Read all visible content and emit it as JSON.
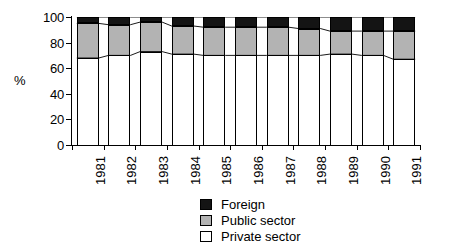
{
  "chart_data": {
    "type": "bar",
    "subtype": "stacked-column-100",
    "title": "",
    "xlabel": "",
    "ylabel": "%",
    "ylim": [
      0,
      100
    ],
    "yticks": [
      0,
      20,
      40,
      60,
      80,
      100
    ],
    "ytick_labels": [
      "0",
      "20",
      "40",
      "60",
      "80",
      "100"
    ],
    "grid": false,
    "legend_position": "bottom-center",
    "categories": [
      "1981",
      "1982",
      "1983",
      "1984",
      "1985",
      "1986",
      "1987",
      "1988",
      "1989",
      "1990",
      "1991"
    ],
    "series": [
      {
        "name": "Private sector",
        "color": "#ffffff",
        "values": [
          68,
          70,
          73,
          71,
          70,
          70,
          70,
          70,
          71,
          70,
          67
        ]
      },
      {
        "name": "Public sector",
        "color": "#b3b3b3",
        "values": [
          27,
          24,
          23,
          22,
          22,
          22,
          22,
          21,
          18,
          19,
          22
        ]
      },
      {
        "name": "Foreign",
        "color": "#141414",
        "values": [
          5,
          6,
          4,
          7,
          8,
          8,
          8,
          9,
          11,
          11,
          11
        ]
      }
    ],
    "cumulative_tops": {
      "private": [
        68,
        70,
        73,
        71,
        70,
        70,
        70,
        70,
        71,
        70,
        67
      ],
      "public": [
        95,
        94,
        96,
        93,
        92,
        92,
        92,
        91,
        89,
        89,
        89
      ],
      "foreign": [
        100,
        100,
        100,
        100,
        100,
        100,
        100,
        100,
        100,
        100,
        100
      ]
    }
  },
  "legend": {
    "items": [
      {
        "label": "Foreign",
        "color": "#141414"
      },
      {
        "label": "Public sector",
        "color": "#b3b3b3"
      },
      {
        "label": "Private sector",
        "color": "#ffffff"
      }
    ]
  }
}
